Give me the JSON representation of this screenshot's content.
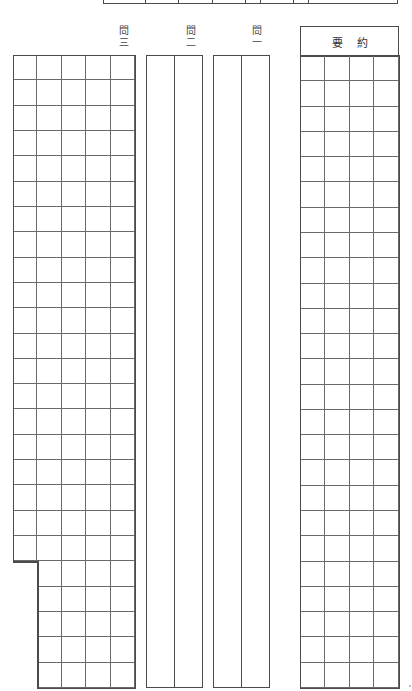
{
  "document": {
    "type": "Japanese answer sheet (genkō-yōshi style)",
    "line_color": "#4a4a4a",
    "background": "#ffffff"
  },
  "top_strip": {
    "dividers_x": [
      144,
      177,
      211,
      244,
      259,
      292,
      307
    ]
  },
  "questions": [
    {
      "id": "q3",
      "label_top": "問",
      "label_bottom": "三",
      "label_x": 116,
      "box": {
        "x": 13,
        "y": 55,
        "w": 122,
        "h": 633
      },
      "columns": 5,
      "rows": 25,
      "first_column_rows": 20
    },
    {
      "id": "q2",
      "label_top": "問",
      "label_bottom": "二",
      "label_x": 183,
      "box": {
        "x": 146,
        "y": 55,
        "w": 57,
        "h": 633
      },
      "columns": 2
    },
    {
      "id": "q1",
      "label_top": "問",
      "label_bottom": "一",
      "label_x": 249,
      "box": {
        "x": 213,
        "y": 55,
        "w": 57,
        "h": 633
      },
      "columns": 2
    }
  ],
  "summary": {
    "label_chars": [
      "要",
      "約"
    ],
    "box": {
      "x": 300,
      "y": 56,
      "w": 99,
      "h": 632
    },
    "columns": 4,
    "rows": 25
  }
}
